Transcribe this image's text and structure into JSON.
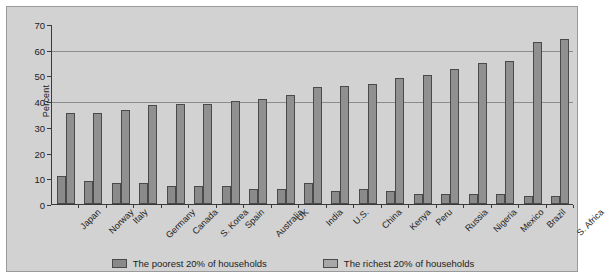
{
  "chart_data": {
    "type": "bar",
    "title": "",
    "subtitle": "",
    "xlabel": "",
    "ylabel": "Percent",
    "ylim": [
      0,
      70
    ],
    "yticks": [
      0,
      10,
      20,
      30,
      40,
      50,
      60,
      70
    ],
    "grid": "horizontal gridlines at 40 and 60",
    "legend_position": "bottom-center",
    "categories": [
      "Japan",
      "Norway",
      "Italy",
      "Germany",
      "Canada",
      "S. Korea",
      "Spain",
      "Australia",
      "UK",
      "India",
      "U.S.",
      "China",
      "Kenya",
      "Peru",
      "Russia",
      "Nigeria",
      "Mexico",
      "Brazil",
      "S. Africa"
    ],
    "series": [
      {
        "name": "The poorest 20% of households",
        "color": "#8a8a8a",
        "values": [
          11,
          9,
          8,
          8,
          7,
          7,
          7,
          6,
          6,
          8,
          5,
          6,
          5,
          4,
          4,
          4,
          4,
          3,
          3
        ]
      },
      {
        "name": "The richest 20% of households",
        "color": "#909090",
        "values": [
          35.5,
          35.5,
          36.5,
          38.5,
          39,
          39,
          40,
          41,
          42.5,
          45.5,
          46,
          46.5,
          49,
          50,
          52.5,
          55,
          55.5,
          63,
          64
        ]
      }
    ]
  },
  "axis": {
    "y_title": "Percent"
  },
  "legend": {
    "items": [
      {
        "label": "The poorest 20% of households",
        "swatch": "poorest-swatch"
      },
      {
        "label": "The richest 20% of households",
        "swatch": "richest-swatch"
      }
    ]
  }
}
